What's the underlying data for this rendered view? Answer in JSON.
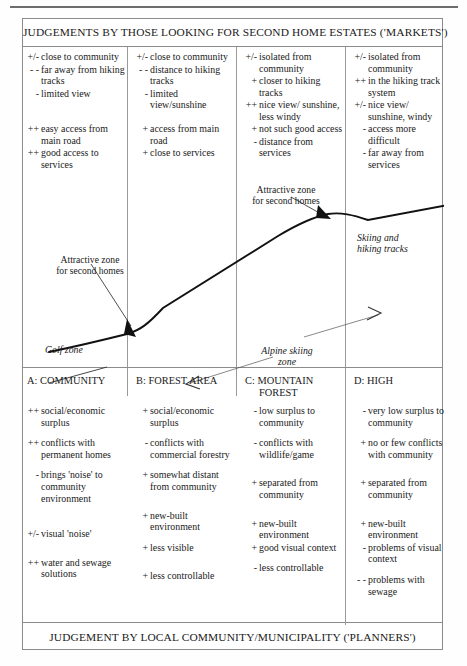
{
  "title_top": "JUDGEMENTS BY THOSE LOOKING FOR SECOND HOME ESTATES ('MARKETS')",
  "title_bottom": "JUDGEMENT BY LOCAL COMMUNITY/MUNICIPALITY ('PLANNERS')",
  "markets": {
    "columns": [
      {
        "id": "A",
        "group1": [
          {
            "sign": "+/-",
            "text": "close to community"
          },
          {
            "sign": "- -",
            "text": "far away from hiking tracks"
          },
          {
            "sign": "-",
            "text": "limited view"
          }
        ],
        "group2": [
          {
            "sign": "++",
            "text": "easy access from main road"
          },
          {
            "sign": "++",
            "text": "good access to services"
          }
        ]
      },
      {
        "id": "B",
        "group1": [
          {
            "sign": "+/-",
            "text": "close to community"
          },
          {
            "sign": "- -",
            "text": "distance to hiking tracks"
          },
          {
            "sign": "-",
            "text": "limited view/sunshine"
          }
        ],
        "group2": [
          {
            "sign": "+",
            "text": "access from main road"
          },
          {
            "sign": "+",
            "text": "close to services"
          }
        ]
      },
      {
        "id": "C",
        "group1": [
          {
            "sign": "+/-",
            "text": "isolated from community"
          },
          {
            "sign": "+",
            "text": "closer to hiking tracks"
          },
          {
            "sign": "++",
            "text": "nice view/ sunshine, less windy"
          }
        ],
        "group2": [
          {
            "sign": "+",
            "text": "not such good access"
          },
          {
            "sign": "-",
            "text": "distance from services"
          }
        ]
      },
      {
        "id": "D",
        "group1": [
          {
            "sign": "+/-",
            "text": "isolated from community"
          },
          {
            "sign": "++",
            "text": "in the hiking track system"
          },
          {
            "sign": "+/-",
            "text": "nice view/ sunshine, windy"
          }
        ],
        "group2": [
          {
            "sign": "-",
            "text": "access more difficult"
          },
          {
            "sign": "-",
            "text": "far away from services"
          }
        ]
      }
    ]
  },
  "diagram": {
    "annotations": [
      {
        "name": "attractive-zone-left",
        "text": "Attractive zone\nfor second homes"
      },
      {
        "name": "attractive-zone-right",
        "text": "Attractive zone\nfor second homes"
      },
      {
        "name": "golf-zone",
        "text": "Golf zone"
      },
      {
        "name": "alpine-skiing-zone",
        "text": "Alpine skiing\nzone"
      },
      {
        "name": "skiing-hiking-tracks",
        "text": "Skiing and\nhiking tracks"
      }
    ],
    "annot_attractive_left_l1": "Attractive zone",
    "annot_attractive_left_l2": "for second homes",
    "annot_attractive_right_l1": "Attractive zone",
    "annot_attractive_right_l2": "for second homes",
    "annot_golf": "Golf zone",
    "annot_alpine_l1": "Alpine skiing",
    "annot_alpine_l2": "zone",
    "annot_skiing_l1": "Skiing and",
    "annot_skiing_l2": "hiking tracks"
  },
  "planners": {
    "columns": [
      {
        "letter": "A:",
        "name_l1": "COMMUNITY",
        "name_l2": "",
        "items": [
          {
            "sign": "++",
            "text": "social/economic surplus"
          },
          {
            "sign": "++",
            "text": "conflicts with permanent homes"
          },
          {
            "sign": "-",
            "text": "brings 'noise' to community environment"
          },
          {
            "sign": "",
            "text": ""
          },
          {
            "sign": "+/-",
            "text": "visual 'noise'"
          },
          {
            "sign": "++",
            "text": "water and sewage solutions"
          }
        ]
      },
      {
        "letter": "B:",
        "name_l1": "FOREST AREA",
        "name_l2": "",
        "items": [
          {
            "sign": "+",
            "text": "social/economic surplus"
          },
          {
            "sign": "-",
            "text": "conflicts with commercial forestry"
          },
          {
            "sign": "+",
            "text": "somewhat distant from community"
          },
          {
            "sign": "+",
            "text": "new-built environment"
          },
          {
            "sign": "+",
            "text": "less visible"
          },
          {
            "sign": "+",
            "text": "less controllable"
          }
        ]
      },
      {
        "letter": "C:",
        "name_l1": "MOUNTAIN",
        "name_l2": "FOREST",
        "items": [
          {
            "sign": "-",
            "text": "low surplus to community"
          },
          {
            "sign": "-",
            "text": "conflicts with wildlife/game"
          },
          {
            "sign": "+",
            "text": "separated from community"
          },
          {
            "sign": "+",
            "text": "new-built environment"
          },
          {
            "sign": "+",
            "text": "good visual context"
          },
          {
            "sign": "-",
            "text": "less controllable"
          }
        ]
      },
      {
        "letter": "D:",
        "name_l1": "HIGH",
        "name_l2": "",
        "items": [
          {
            "sign": "-",
            "text": "very low surplus to community"
          },
          {
            "sign": "+",
            "text": "no or few conflicts with community"
          },
          {
            "sign": "+",
            "text": "separated from community"
          },
          {
            "sign": "+",
            "text": "new-built environment"
          },
          {
            "sign": "-",
            "text": "problems of visual context"
          },
          {
            "sign": "- -",
            "text": "problems with sewage"
          }
        ]
      }
    ]
  }
}
